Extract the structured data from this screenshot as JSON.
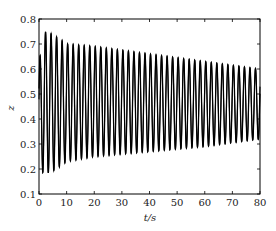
{
  "chart_data": {
    "type": "line",
    "title": "",
    "xlabel": "t/s",
    "ylabel": "z",
    "xlim": [
      0,
      80
    ],
    "ylim": [
      0.1,
      0.8
    ],
    "xticks": [
      0,
      10,
      20,
      30,
      40,
      50,
      60,
      70,
      80
    ],
    "yticks": [
      0.1,
      0.2,
      0.3,
      0.4,
      0.5,
      0.6,
      0.7,
      0.8
    ],
    "xtick_labels": [
      "0",
      "10",
      "20",
      "30",
      "40",
      "50",
      "60",
      "70",
      "80"
    ],
    "ytick_labels": [
      "0.1",
      "0.2",
      "0.3",
      "0.4",
      "0.5",
      "0.6",
      "0.7",
      "0.8"
    ],
    "grid": false,
    "legend": null,
    "series": [
      {
        "name": "z(t)",
        "color": "#000000",
        "description": "Oscillation with period ~2 s about mean ~0.46; amplitude decays slowly",
        "period_s": 2.0,
        "mean": 0.46,
        "upper_envelope": {
          "t": [
            0,
            2,
            5,
            10,
            20,
            40,
            60,
            80
          ],
          "z": [
            0.63,
            0.75,
            0.74,
            0.7,
            0.69,
            0.66,
            0.63,
            0.6
          ]
        },
        "lower_envelope": {
          "t": [
            0,
            2,
            5,
            10,
            20,
            40,
            60,
            80
          ],
          "z": [
            0.2,
            0.18,
            0.19,
            0.23,
            0.25,
            0.27,
            0.29,
            0.32
          ]
        }
      }
    ]
  }
}
